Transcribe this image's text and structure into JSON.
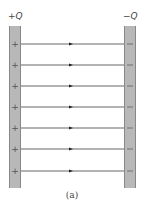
{
  "diagram": {
    "type": "parallel-plate-capacitor-field",
    "caption": "(a)",
    "left_plate": {
      "label": "+Q",
      "sign": "+",
      "charge_marks": [
        "+",
        "+",
        "+",
        "+",
        "+",
        "+",
        "+"
      ]
    },
    "right_plate": {
      "label": "−Q",
      "sign": "−",
      "charge_marks": [
        "−",
        "−",
        "−",
        "−",
        "−",
        "−",
        "−"
      ]
    },
    "field_lines": {
      "count": 7,
      "direction": "left-to-right",
      "y_positions": [
        44,
        65,
        86,
        107,
        128,
        149,
        171
      ]
    },
    "colors": {
      "plate_fill": "#b8b8b8",
      "plate_edge": "#888888",
      "line": "#555555",
      "text": "#444444"
    }
  }
}
